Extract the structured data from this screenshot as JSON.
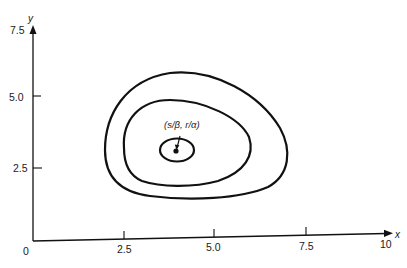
{
  "figure": {
    "x_axis": {
      "name": "x",
      "origin_label": "0",
      "ticks": [
        {
          "label": "2.5"
        },
        {
          "label": "5.0"
        },
        {
          "label": "7.5"
        },
        {
          "label": "10"
        }
      ]
    },
    "y_axis": {
      "name": "y",
      "ticks": [
        {
          "label": "2.5"
        },
        {
          "label": "5.0"
        },
        {
          "label": "7.5"
        }
      ]
    },
    "equilibrium": {
      "label": "(s/β, r/α)",
      "x": 4.0,
      "y": 3.0
    },
    "orbits": [
      {
        "name": "inner"
      },
      {
        "name": "middle"
      },
      {
        "name": "outer"
      }
    ],
    "line_color": "#111111"
  }
}
